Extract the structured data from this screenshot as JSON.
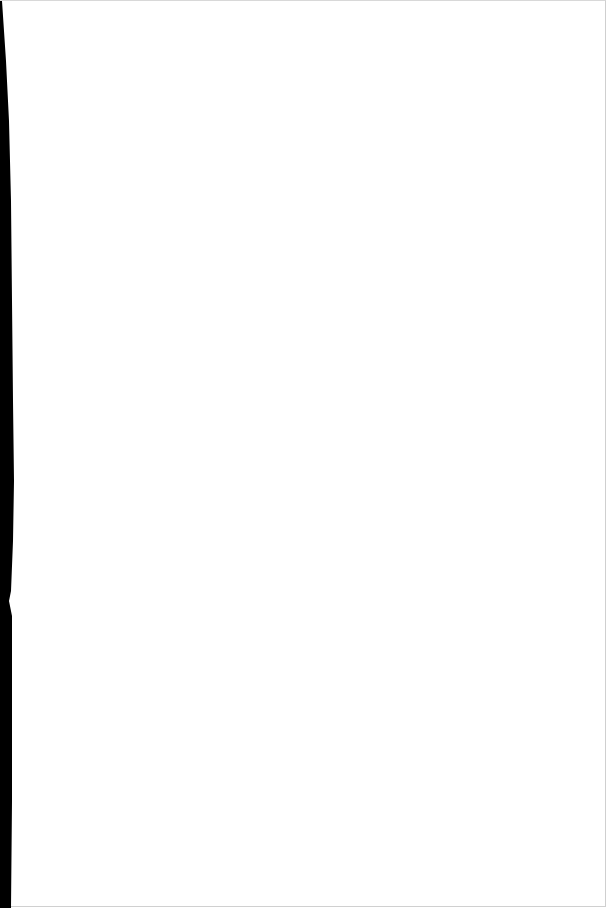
{
  "page": {
    "content": "",
    "background_color": "#ffffff",
    "scan_edge_color": "#000000"
  }
}
